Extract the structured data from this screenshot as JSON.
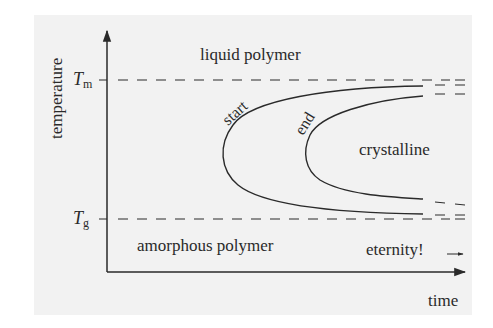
{
  "diagram": {
    "title": "",
    "type": "TTT diagram (polymer crystallization)",
    "axes": {
      "y_label": "temperature",
      "x_label": "time",
      "y_ticks": [
        {
          "symbol": "T",
          "subscript": "m",
          "name": "melting temperature"
        },
        {
          "symbol": "T",
          "subscript": "g",
          "name": "glass transition temperature"
        }
      ]
    },
    "regions": {
      "top": "liquid polymer",
      "middle": "crystalline",
      "bottom": "amorphous polymer"
    },
    "curves": [
      {
        "label": "start",
        "shape": "C-curve"
      },
      {
        "label": "end",
        "shape": "C-curve"
      }
    ],
    "annotation": "eternity!",
    "colors": {
      "background": "#f2f2f2",
      "line": "#2a2a2a"
    }
  }
}
